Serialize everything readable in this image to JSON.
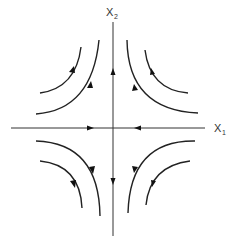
{
  "diagram": {
    "type": "phase-portrait",
    "title": "",
    "colors": {
      "background": "#ffffff",
      "stroke": "#222222",
      "axis": "#333333"
    },
    "axes": {
      "horizontal": {
        "label_main": "X",
        "label_sub": "1",
        "direction": "inward toward origin"
      },
      "vertical": {
        "label_main": "X",
        "label_sub": "2",
        "direction": "outward from origin"
      }
    },
    "trajectories": [
      {
        "quadrant": "upper-left",
        "ring": "outer",
        "flow": "up-right then up"
      },
      {
        "quadrant": "upper-left",
        "ring": "inner",
        "flow": "up-right then up"
      },
      {
        "quadrant": "upper-right",
        "ring": "outer",
        "flow": "left then up"
      },
      {
        "quadrant": "upper-right",
        "ring": "inner",
        "flow": "left then up"
      },
      {
        "quadrant": "lower-left",
        "ring": "outer",
        "flow": "right then down"
      },
      {
        "quadrant": "lower-left",
        "ring": "inner",
        "flow": "right then down"
      },
      {
        "quadrant": "lower-right",
        "ring": "outer",
        "flow": "left then down"
      },
      {
        "quadrant": "lower-right",
        "ring": "inner",
        "flow": "left then down"
      }
    ]
  }
}
